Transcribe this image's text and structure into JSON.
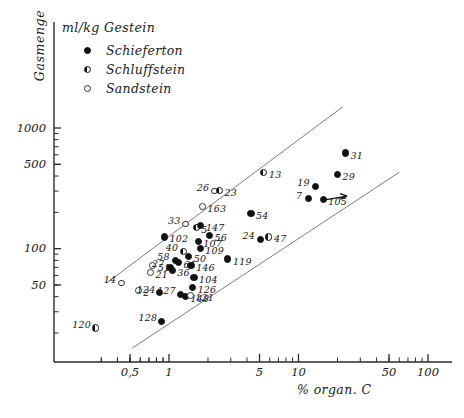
{
  "chart_data": {
    "type": "scatter",
    "title": "",
    "unit_caption": "ml/kg Gestein",
    "ylabel": "Gasmenge",
    "xlabel": "% organ. C",
    "xscale": "log",
    "yscale": "log",
    "xlim": [
      0.2,
      130
    ],
    "ylim": [
      13,
      2000
    ],
    "xticks": [
      0.5,
      1,
      5,
      10,
      50,
      100
    ],
    "xticklabels": [
      "0,5",
      "1",
      "5",
      "10",
      "50",
      "100"
    ],
    "yticks": [
      50,
      100,
      500,
      1000
    ],
    "yticklabels": [
      "50",
      "100",
      "500",
      "1000"
    ],
    "grid": false,
    "legend_position": "top-left",
    "legend": [
      {
        "label": "Schieferton",
        "marker": "full"
      },
      {
        "label": "Schluffstein",
        "marker": "half"
      },
      {
        "label": "Sandstein",
        "marker": "open"
      }
    ],
    "trend_lines": [
      {
        "name": "upper-envelope",
        "x": [
          0.33,
          22.0
        ],
        "y": [
          52,
          1500
        ]
      },
      {
        "name": "lower-envelope",
        "x": [
          0.52,
          60.0
        ],
        "y": [
          15,
          430
        ]
      }
    ],
    "annotations": [
      {
        "name": "arrow-at-105",
        "point_label": "105"
      }
    ],
    "points": [
      {
        "label": "120",
        "x": 0.27,
        "y": 22,
        "marker": "half"
      },
      {
        "label": "14",
        "x": 0.43,
        "y": 52,
        "marker": "open"
      },
      {
        "label": "2",
        "x": 0.58,
        "y": 45,
        "marker": "open"
      },
      {
        "label": "21",
        "x": 0.72,
        "y": 63,
        "marker": "open"
      },
      {
        "label": "51",
        "x": 0.75,
        "y": 72,
        "marker": "open"
      },
      {
        "label": "124",
        "x": 0.85,
        "y": 43,
        "marker": "full"
      },
      {
        "label": "128",
        "x": 0.88,
        "y": 25,
        "marker": "full"
      },
      {
        "label": "102",
        "x": 0.92,
        "y": 125,
        "marker": "full"
      },
      {
        "label": "27",
        "x": 1.02,
        "y": 70,
        "marker": "full"
      },
      {
        "label": "36",
        "x": 1.06,
        "y": 66,
        "marker": "full"
      },
      {
        "label": "58",
        "x": 1.12,
        "y": 80,
        "marker": "full"
      },
      {
        "label": "61",
        "x": 1.18,
        "y": 77,
        "marker": "full"
      },
      {
        "label": "127",
        "x": 1.22,
        "y": 42,
        "marker": "full"
      },
      {
        "label": "148",
        "x": 1.34,
        "y": 40,
        "marker": "full"
      },
      {
        "label": "121",
        "x": 1.46,
        "y": 41,
        "marker": "open"
      },
      {
        "label": "40",
        "x": 1.3,
        "y": 95,
        "marker": "half"
      },
      {
        "label": "50",
        "x": 1.42,
        "y": 86,
        "marker": "full"
      },
      {
        "label": "146",
        "x": 1.48,
        "y": 73,
        "marker": "full"
      },
      {
        "label": "104",
        "x": 1.56,
        "y": 58,
        "marker": "full"
      },
      {
        "label": "126",
        "x": 1.52,
        "y": 48,
        "marker": "full"
      },
      {
        "label": "33",
        "x": 1.35,
        "y": 160,
        "marker": "open"
      },
      {
        "label": "5",
        "x": 1.62,
        "y": 150,
        "marker": "half"
      },
      {
        "label": "147",
        "x": 1.76,
        "y": 155,
        "marker": "full"
      },
      {
        "label": "107",
        "x": 1.68,
        "y": 115,
        "marker": "full"
      },
      {
        "label": "109",
        "x": 1.74,
        "y": 100,
        "marker": "full"
      },
      {
        "label": "163",
        "x": 1.82,
        "y": 225,
        "marker": "open"
      },
      {
        "label": "56",
        "x": 2.05,
        "y": 128,
        "marker": "full"
      },
      {
        "label": "26",
        "x": 2.25,
        "y": 300,
        "marker": "open"
      },
      {
        "label": "23",
        "x": 2.45,
        "y": 305,
        "marker": "half"
      },
      {
        "label": "119",
        "x": 2.85,
        "y": 82,
        "marker": "full"
      },
      {
        "label": "54",
        "x": 4.3,
        "y": 195,
        "marker": "full"
      },
      {
        "label": "13",
        "x": 5.4,
        "y": 430,
        "marker": "half"
      },
      {
        "label": "24",
        "x": 5.1,
        "y": 120,
        "marker": "full"
      },
      {
        "label": "47",
        "x": 5.9,
        "y": 125,
        "marker": "half"
      },
      {
        "label": "7",
        "x": 12.0,
        "y": 260,
        "marker": "full"
      },
      {
        "label": "19",
        "x": 13.5,
        "y": 330,
        "marker": "full"
      },
      {
        "label": "105",
        "x": 15.5,
        "y": 255,
        "marker": "full"
      },
      {
        "label": "29",
        "x": 20.0,
        "y": 410,
        "marker": "full"
      },
      {
        "label": "31",
        "x": 23.0,
        "y": 620,
        "marker": "full"
      }
    ]
  }
}
